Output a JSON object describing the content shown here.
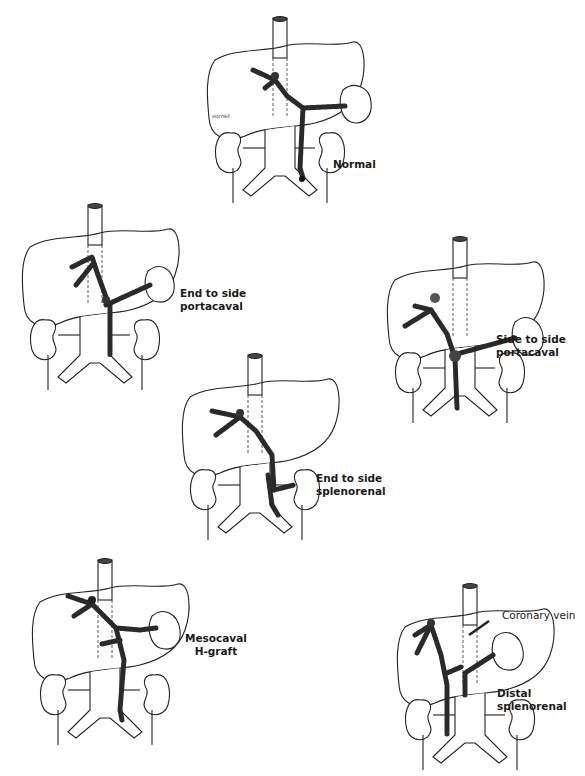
{
  "figure": {
    "panels": [
      {
        "id": "normal",
        "label_lines": [
          "Normal"
        ]
      },
      {
        "id": "end-to-side-portacaval",
        "label_lines": [
          "End to side",
          "portacaval"
        ]
      },
      {
        "id": "side-to-side-portacaval",
        "label_lines": [
          "Side to side",
          "portacaval"
        ]
      },
      {
        "id": "end-to-side-splenorenal",
        "label_lines": [
          "End to side",
          "splenorenal"
        ]
      },
      {
        "id": "mesocaval-h-graft",
        "label_lines": [
          "Mesocaval",
          "H-graft"
        ]
      },
      {
        "id": "distal-splenorenal",
        "label_lines": [
          "Distal",
          "splenorenal"
        ],
        "annotation": "Coronary vein"
      }
    ],
    "artist_signature": "Hornsa"
  }
}
